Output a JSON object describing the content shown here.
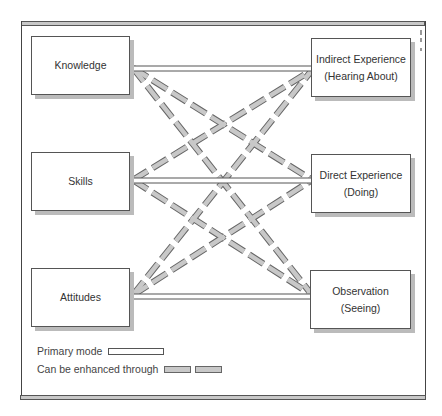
{
  "diagram": {
    "left_nodes": [
      {
        "label": "Knowledge"
      },
      {
        "label": "Skills"
      },
      {
        "label": "Attitudes"
      }
    ],
    "right_nodes": [
      {
        "line1": "Indirect Experience",
        "line2": "(Hearing About)"
      },
      {
        "line1": "Direct Experience",
        "line2": "(Doing)"
      },
      {
        "line1": "Observation",
        "line2": "(Seeing)"
      }
    ],
    "edges": {
      "primary": [
        [
          "Knowledge",
          "Indirect Experience"
        ],
        [
          "Skills",
          "Direct Experience"
        ],
        [
          "Attitudes",
          "Observation"
        ]
      ],
      "enhanced": [
        [
          "Knowledge",
          "Direct Experience"
        ],
        [
          "Knowledge",
          "Observation"
        ],
        [
          "Skills",
          "Indirect Experience"
        ],
        [
          "Skills",
          "Observation"
        ],
        [
          "Attitudes",
          "Indirect Experience"
        ],
        [
          "Attitudes",
          "Direct Experience"
        ]
      ]
    },
    "legend": {
      "primary_label": "Primary mode",
      "enhanced_label": "Can be enhanced through"
    },
    "colors": {
      "border": "#555555",
      "dash_fill": "#c8c8c8",
      "shadow": "#bbbbbb"
    }
  }
}
